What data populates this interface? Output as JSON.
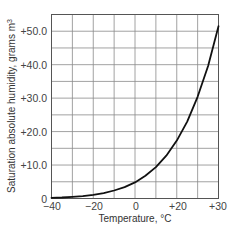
{
  "chart_data": {
    "type": "line",
    "title": "",
    "xlabel": "Temperature, °C",
    "ylabel": "Saturation absolute humidity, grams m3",
    "x_tick_labels": [
      "−40",
      "−20",
      "0",
      "+20",
      "+30"
    ],
    "y_tick_labels": [
      "0",
      "+10.0",
      "+20.0",
      "+30.0",
      "+40.0",
      "+50.0"
    ],
    "xlim": [
      -40,
      40
    ],
    "ylim": [
      0,
      55
    ],
    "grid": true,
    "x_grid_step": 10,
    "y_grid_step": 5,
    "legend": null,
    "series": [
      {
        "name": "Saturation absolute humidity",
        "color": "#111111",
        "x": [
          -40,
          -35,
          -30,
          -25,
          -20,
          -15,
          -10,
          -5,
          0,
          5,
          10,
          15,
          20,
          25,
          30,
          35,
          40
        ],
        "y": [
          0.2,
          0.3,
          0.5,
          0.7,
          1.1,
          1.6,
          2.4,
          3.4,
          4.8,
          6.8,
          9.4,
          12.8,
          17.3,
          23.0,
          30.4,
          39.6,
          51.5
        ]
      }
    ]
  },
  "labels": {
    "x_axis": "Temperature, °C",
    "y_axis": "Saturation absolute humidity, grams m",
    "y_axis_superscript": "3"
  },
  "colors": {
    "grid": "#8a8a8a",
    "frame": "#555555",
    "curve": "#111111"
  }
}
